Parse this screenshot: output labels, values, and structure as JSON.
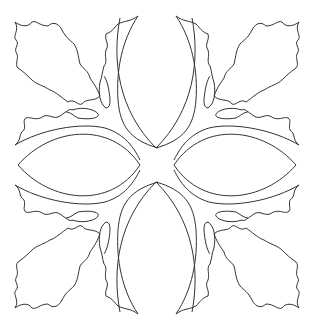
{
  "figure": {
    "title": "",
    "stroke_color": "#333333",
    "background": "#ffffff",
    "petals": 4,
    "holly_sprays": 4
  }
}
